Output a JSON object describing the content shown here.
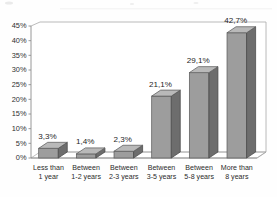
{
  "chart_data": {
    "type": "bar",
    "title": "",
    "subtitle": "",
    "xlabel": "",
    "ylabel": "",
    "categories": [
      "Less than 1 year",
      "Between 1-2 years",
      "Between 2-3 years",
      "Between 3-5 years",
      "Between 5-8 years",
      "More than 8 years"
    ],
    "category_lines": [
      [
        "Less than",
        "1 year"
      ],
      [
        "Between",
        "1-2 years"
      ],
      [
        "Between",
        "2-3 years"
      ],
      [
        "Between",
        "3-5 years"
      ],
      [
        "Between",
        "5-8 years"
      ],
      [
        "More than",
        "8 years"
      ]
    ],
    "values": [
      3.3,
      1.4,
      2.3,
      21.1,
      29.1,
      42.7
    ],
    "data_labels": [
      "3,3%",
      "1,4%",
      "2,3%",
      "21,1%",
      "29,1%",
      "42,7%"
    ],
    "ylim": [
      0,
      45
    ],
    "ytick_values": [
      0,
      5,
      10,
      15,
      20,
      25,
      30,
      35,
      40,
      45
    ],
    "ytick_labels": [
      "0%",
      "5%",
      "10%",
      "15%",
      "20%",
      "25%",
      "30%",
      "35%",
      "40%",
      "45%"
    ],
    "grid": false,
    "legend": null,
    "legend_position": "none",
    "three_d": true,
    "decimal_separator": ",",
    "colors": {
      "bar_front": "#9d9d9d",
      "bar_side": "#6d6d6d",
      "bar_top": "#b9b9b9",
      "axis": "#8d8d8d",
      "text": "#1f1f1f",
      "background": "#fefefe"
    }
  }
}
